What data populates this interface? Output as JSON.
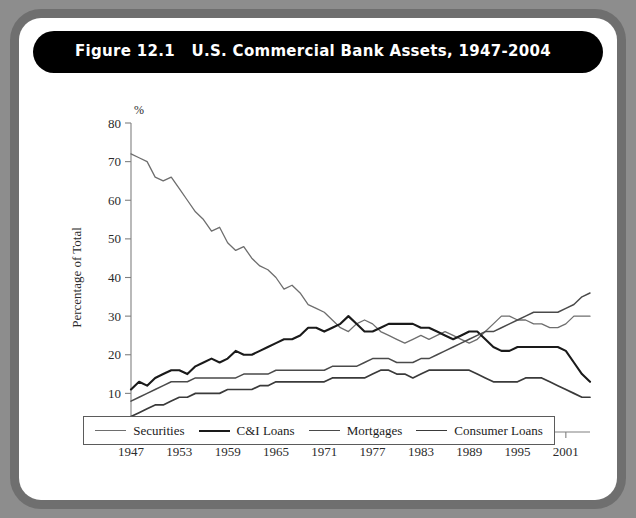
{
  "figure": {
    "label": "Figure 12.1",
    "title": "U.S. Commercial Bank Assets, 1947-2004",
    "title_full": "Figure 12.1   U.S. Commercial Bank Assets, 1947-2004"
  },
  "colors": {
    "frame": "#8d8d8d",
    "card": "#ffffff",
    "title_bar": "#000000",
    "title_text": "#ffffff",
    "axis": "#808080",
    "securities": "#6e6e6e",
    "ci_loans": "#1a1a1a",
    "mortgages": "#4a4a4a",
    "consumer_loans": "#3a3a3a"
  },
  "legend": {
    "position": "bottom",
    "items": [
      {
        "label": "Securities",
        "color": "#6e6e6e",
        "width": 1.3
      },
      {
        "label": "C&I Loans",
        "color": "#1a1a1a",
        "width": 2.1
      },
      {
        "label": "Mortgages",
        "color": "#4a4a4a",
        "width": 1.5
      },
      {
        "label": "Consumer Loans",
        "color": "#3a3a3a",
        "width": 1.7
      }
    ]
  },
  "chart_data": {
    "type": "line",
    "title": "U.S. Commercial Bank Assets, 1947-2004",
    "xlabel": "",
    "ylabel": "Percentage of Total",
    "y_unit": "%",
    "xlim": [
      1947,
      2004
    ],
    "ylim": [
      0,
      80
    ],
    "ytick_step": 10,
    "yticks": [
      0,
      10,
      20,
      30,
      40,
      50,
      60,
      70,
      80
    ],
    "xticks": [
      1947,
      1953,
      1959,
      1965,
      1971,
      1977,
      1983,
      1989,
      1995,
      2001
    ],
    "grid": false,
    "x": [
      1947,
      1948,
      1949,
      1950,
      1951,
      1952,
      1953,
      1954,
      1955,
      1956,
      1957,
      1958,
      1959,
      1960,
      1961,
      1962,
      1963,
      1964,
      1965,
      1966,
      1967,
      1968,
      1969,
      1970,
      1971,
      1972,
      1973,
      1974,
      1975,
      1976,
      1977,
      1978,
      1979,
      1980,
      1981,
      1982,
      1983,
      1984,
      1985,
      1986,
      1987,
      1988,
      1989,
      1990,
      1991,
      1992,
      1993,
      1994,
      1995,
      1996,
      1997,
      1998,
      1999,
      2000,
      2001,
      2002,
      2003,
      2004
    ],
    "series": [
      {
        "name": "Securities",
        "color": "#6e6e6e",
        "values": [
          72,
          71,
          70,
          66,
          65,
          66,
          63,
          60,
          57,
          55,
          52,
          53,
          49,
          47,
          48,
          45,
          43,
          42,
          40,
          37,
          38,
          36,
          33,
          32,
          31,
          29,
          27,
          26,
          28,
          29,
          28,
          26,
          25,
          24,
          23,
          24,
          25,
          24,
          25,
          26,
          25,
          24,
          23,
          24,
          26,
          28,
          30,
          30,
          29,
          29,
          28,
          28,
          27,
          27,
          28,
          30,
          30,
          30
        ]
      },
      {
        "name": "C&I Loans",
        "color": "#1a1a1a",
        "values": [
          11,
          13,
          12,
          14,
          15,
          16,
          16,
          15,
          17,
          18,
          19,
          18,
          19,
          21,
          20,
          20,
          21,
          22,
          23,
          24,
          24,
          25,
          27,
          27,
          26,
          27,
          28,
          30,
          28,
          26,
          26,
          27,
          28,
          28,
          28,
          28,
          27,
          27,
          26,
          25,
          24,
          25,
          26,
          26,
          24,
          22,
          21,
          21,
          22,
          22,
          22,
          22,
          22,
          22,
          21,
          18,
          15,
          13
        ]
      },
      {
        "name": "Mortgages",
        "color": "#4a4a4a",
        "values": [
          8,
          9,
          10,
          11,
          12,
          13,
          13,
          13,
          14,
          14,
          14,
          14,
          14,
          14,
          15,
          15,
          15,
          15,
          16,
          16,
          16,
          16,
          16,
          16,
          16,
          17,
          17,
          17,
          17,
          18,
          19,
          19,
          19,
          18,
          18,
          18,
          19,
          19,
          20,
          21,
          22,
          23,
          24,
          25,
          26,
          26,
          27,
          28,
          29,
          30,
          31,
          31,
          31,
          31,
          32,
          33,
          35,
          36
        ]
      },
      {
        "name": "Consumer Loans",
        "color": "#3a3a3a",
        "values": [
          4,
          5,
          6,
          7,
          7,
          8,
          9,
          9,
          10,
          10,
          10,
          10,
          11,
          11,
          11,
          11,
          12,
          12,
          13,
          13,
          13,
          13,
          13,
          13,
          13,
          14,
          14,
          14,
          14,
          14,
          15,
          16,
          16,
          15,
          15,
          14,
          15,
          16,
          16,
          16,
          16,
          16,
          16,
          15,
          14,
          13,
          13,
          13,
          13,
          14,
          14,
          14,
          13,
          12,
          11,
          10,
          9,
          9
        ]
      }
    ]
  }
}
